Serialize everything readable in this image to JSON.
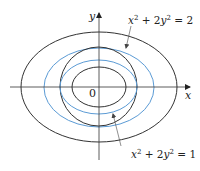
{
  "diagram": {
    "axes": {
      "x_label": "x",
      "y_label": "y",
      "origin_label": "0"
    },
    "curves": [
      {
        "name": "outer-black-ellipse",
        "color": "#333333",
        "cx": 99,
        "cy": 87,
        "rx": 78,
        "ry": 55
      },
      {
        "name": "outer-blue-ellipse",
        "color": "#5b9bd5",
        "cx": 99,
        "cy": 87,
        "rx": 55,
        "ry": 39
      },
      {
        "name": "black-circle",
        "color": "#333333",
        "cx": 99,
        "cy": 87,
        "rx": 38.5,
        "ry": 39.5
      },
      {
        "name": "inner-blue-ellipse",
        "color": "#5b9bd5",
        "cx": 99,
        "cy": 87,
        "rx": 38.5,
        "ry": 27
      },
      {
        "name": "inner-black-ellipse",
        "color": "#333333",
        "cx": 99,
        "cy": 87,
        "rx": 27,
        "ry": 20
      }
    ],
    "labels": {
      "top": {
        "x_term": "x",
        "exp1": "2",
        "plus": " + 2",
        "y_term": "y",
        "exp2": "2",
        "rhs": " = 2"
      },
      "bottom": {
        "x_term": "x",
        "exp1": "2",
        "plus": " + 2",
        "y_term": "y",
        "exp2": "2",
        "rhs": " = 1"
      }
    },
    "colors": {
      "black": "#333333",
      "blue": "#5b9bd5"
    }
  }
}
